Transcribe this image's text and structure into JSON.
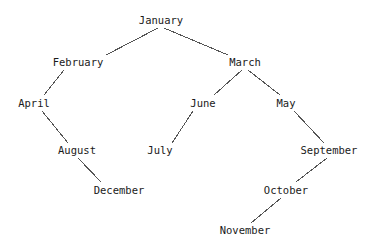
{
  "diagram": {
    "type": "binary-tree",
    "background_color": "#ffffff",
    "text_color": "#1a1a1a",
    "edge_color": "#555555",
    "root": "January",
    "nodes": [
      {
        "id": "january",
        "label": "January",
        "x": 161,
        "y": 20,
        "depth": 0
      },
      {
        "id": "february",
        "label": "February",
        "x": 78,
        "y": 62,
        "depth": 1
      },
      {
        "id": "march",
        "label": "March",
        "x": 245,
        "y": 62,
        "depth": 1
      },
      {
        "id": "april",
        "label": "April",
        "x": 34,
        "y": 103,
        "depth": 2
      },
      {
        "id": "june",
        "label": "June",
        "x": 203,
        "y": 103,
        "depth": 2
      },
      {
        "id": "may",
        "label": "May",
        "x": 286,
        "y": 103,
        "depth": 2
      },
      {
        "id": "august",
        "label": "August",
        "x": 77,
        "y": 150,
        "depth": 3
      },
      {
        "id": "july",
        "label": "July",
        "x": 160,
        "y": 150,
        "depth": 3
      },
      {
        "id": "september",
        "label": "September",
        "x": 329,
        "y": 150,
        "depth": 3
      },
      {
        "id": "december",
        "label": "December",
        "x": 119,
        "y": 190,
        "depth": 4
      },
      {
        "id": "october",
        "label": "October",
        "x": 286,
        "y": 190,
        "depth": 4
      },
      {
        "id": "november",
        "label": "November",
        "x": 245,
        "y": 230,
        "depth": 5
      }
    ],
    "edges": [
      {
        "from": "january",
        "to": "february",
        "x1": 158,
        "y1": 28,
        "x2": 106,
        "y2": 55
      },
      {
        "from": "january",
        "to": "march",
        "x1": 164,
        "y1": 28,
        "x2": 228,
        "y2": 55
      },
      {
        "from": "february",
        "to": "april",
        "x1": 64,
        "y1": 70,
        "x2": 44,
        "y2": 95
      },
      {
        "from": "april",
        "to": "august",
        "x1": 42,
        "y1": 111,
        "x2": 68,
        "y2": 143
      },
      {
        "from": "august",
        "to": "december",
        "x1": 78,
        "y1": 158,
        "x2": 101,
        "y2": 182
      },
      {
        "from": "march",
        "to": "june",
        "x1": 242,
        "y1": 70,
        "x2": 214,
        "y2": 95
      },
      {
        "from": "march",
        "to": "may",
        "x1": 248,
        "y1": 70,
        "x2": 280,
        "y2": 95
      },
      {
        "from": "june",
        "to": "july",
        "x1": 193,
        "y1": 111,
        "x2": 172,
        "y2": 143
      },
      {
        "from": "may",
        "to": "september",
        "x1": 294,
        "y1": 111,
        "x2": 324,
        "y2": 143
      },
      {
        "from": "september",
        "to": "october",
        "x1": 327,
        "y1": 158,
        "x2": 296,
        "y2": 182
      },
      {
        "from": "october",
        "to": "november",
        "x1": 281,
        "y1": 198,
        "x2": 251,
        "y2": 223
      }
    ]
  }
}
